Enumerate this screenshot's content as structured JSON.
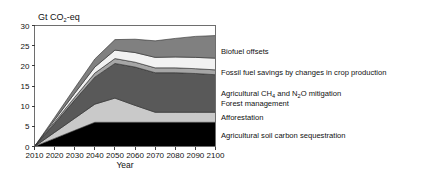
{
  "figure": {
    "unit_label": "Gt CO2-eq",
    "unit_label_prefix": "Gt CO",
    "unit_label_sub": "2",
    "unit_label_suffix": "-eq",
    "xlabel": "Year",
    "ylabel": ""
  },
  "axes": {
    "x_ticks": [
      "2010",
      "2020",
      "2030",
      "2040",
      "2050",
      "2060",
      "2070",
      "2080",
      "2090",
      "2100"
    ],
    "y_ticks": [
      "0",
      "5",
      "10",
      "15",
      "20",
      "25",
      "30"
    ],
    "xlim": [
      2010,
      2100
    ],
    "ylim": [
      0,
      30
    ]
  },
  "legend": {
    "items": [
      {
        "label": "Biofuel offsets",
        "color": "#808080"
      },
      {
        "label": "Fossil fuel savings by changes in crop production",
        "color": "#f2f2f2"
      },
      {
        "label": "Agricultural CH4 and N2O mitigation",
        "color": "#a6a6a6",
        "label_parts": [
          "Agricultural CH",
          "4",
          " and N",
          "2",
          "O mitigation"
        ]
      },
      {
        "label": "Forest management",
        "color": "#595959"
      },
      {
        "label": "Afforestation",
        "color": "#c9c9c9"
      },
      {
        "label": "Agricultural soil carbon sequestration",
        "color": "#000000"
      }
    ]
  },
  "chart_data": {
    "type": "area",
    "title": "",
    "xlabel": "Year",
    "ylabel": "Gt CO2-eq",
    "xlim": [
      2010,
      2100
    ],
    "ylim": [
      0,
      30
    ],
    "grid": false,
    "legend_position": "right",
    "stacked": true,
    "x": [
      2010,
      2020,
      2030,
      2040,
      2050,
      2060,
      2070,
      2080,
      2090,
      2100
    ],
    "series": [
      {
        "name": "Agricultural soil carbon sequestration",
        "color": "#000000",
        "values": [
          0,
          2.0,
          4.0,
          6.0,
          6.0,
          6.0,
          6.0,
          6.0,
          6.0,
          6.0
        ]
      },
      {
        "name": "Afforestation",
        "color": "#c9c9c9",
        "values": [
          0,
          1.5,
          3.0,
          4.5,
          6.0,
          4.2,
          2.5,
          2.5,
          2.5,
          2.5
        ]
      },
      {
        "name": "Forest management",
        "color": "#595959",
        "values": [
          0,
          2.2,
          4.5,
          6.7,
          8.6,
          9.5,
          9.8,
          9.8,
          9.6,
          9.3
        ]
      },
      {
        "name": "Agricultural CH4 and N2O mitigation",
        "color": "#a6a6a6",
        "values": [
          0,
          0.4,
          0.7,
          1.0,
          1.2,
          1.2,
          1.2,
          1.2,
          1.2,
          1.2
        ]
      },
      {
        "name": "Fossil fuel savings by changes in crop production",
        "color": "#f2f2f2",
        "values": [
          0,
          0.5,
          1.0,
          1.5,
          2.1,
          2.4,
          2.6,
          2.7,
          2.8,
          2.9
        ]
      },
      {
        "name": "Biofuel offsets",
        "color": "#808080",
        "values": [
          0,
          0.6,
          1.3,
          2.0,
          2.6,
          3.3,
          4.1,
          4.6,
          5.2,
          5.6
        ]
      }
    ],
    "stack_tops": {
      "2010": 0,
      "2020": 7.2,
      "2030": 14.5,
      "2040": 21.7,
      "2050": 26.5,
      "2060": 26.6,
      "2070": 26.2,
      "2080": 26.8,
      "2090": 27.3,
      "2100": 27.5
    }
  }
}
